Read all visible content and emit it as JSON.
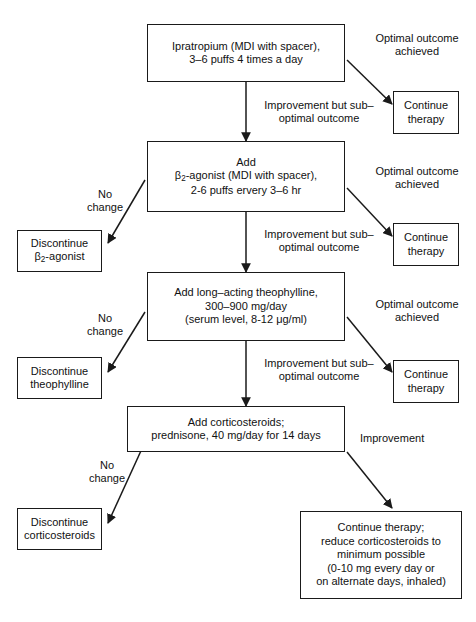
{
  "diagram": {
    "type": "flowchart",
    "stroke_color": "#1a1a1a",
    "background_color": "#ffffff"
  },
  "nodes": {
    "step1": "Ipratropium (MDI with spacer),\n3–6 puffs 4 times a day",
    "step2_line1": "Add",
    "step2_line2_pre": "β",
    "step2_line2_sub": "2",
    "step2_line2_post": "-agonist (MDI with spacer),",
    "step2_line3": "2-6 puffs ervery 3–6 hr",
    "step3": "Add long–acting theophylline,\n300–900 mg/day\n(serum level, 8-12 μg/ml)",
    "step4": "Add corticosteroids;\nprednisone, 40 mg/day for 14 days",
    "continue1": "Continue\ntherapy",
    "continue2": "Continue\ntherapy",
    "continue3": "Continue\ntherapy",
    "discontinue1_pre": "Discontinue\nβ",
    "discontinue1_sub": "2",
    "discontinue1_post": "-agonist",
    "discontinue2": "Discontinue\ntheophylline",
    "discontinue3": "Discontinue\ncorticosteroids",
    "final": "Continue therapy;\nreduce corticosteroids to\nminimum possible\n(0-10 mg every day or\non alternate days, inhaled)"
  },
  "edge_labels": {
    "optimal1": "Optimal outcome\nachieved",
    "optimal2": "Optimal outcome\nachieved",
    "optimal3": "Optimal outcome\nachieved",
    "suboptimal1": "Improvement but sub–\noptimal outcome",
    "suboptimal2": "Improvement but sub–\noptimal outcome",
    "suboptimal3": "Improvement but sub–\noptimal outcome",
    "nochange1": "No\nchange",
    "nochange2": "No\nchange",
    "nochange3": "No\nchange",
    "improvement": "Improvement"
  }
}
